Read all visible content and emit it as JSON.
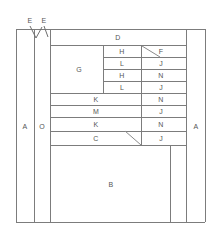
{
  "diagram": {
    "line_color": "#7c7c7c",
    "label_color": "#555555",
    "background": "#ffffff",
    "frame": {
      "x": 16,
      "y": 29,
      "width": 189,
      "height": 193
    },
    "dimension_markers": [
      {
        "label": "E",
        "x": 30,
        "y": 20
      },
      {
        "label": "E",
        "x": 44,
        "y": 20
      }
    ],
    "labels": [
      {
        "name": "region-a-left",
        "text": "A",
        "x": 25,
        "y": 126
      },
      {
        "name": "region-o",
        "text": "O",
        "x": 42,
        "y": 126
      },
      {
        "name": "region-a-right",
        "text": "A",
        "x": 196,
        "y": 126
      },
      {
        "name": "region-d",
        "text": "D",
        "x": 118,
        "y": 37
      },
      {
        "name": "region-g",
        "text": "G",
        "x": 79,
        "y": 69
      },
      {
        "name": "region-h-1",
        "text": "H",
        "x": 122,
        "y": 51
      },
      {
        "name": "region-f",
        "text": "F",
        "x": 161,
        "y": 51
      },
      {
        "name": "region-l-1",
        "text": "L",
        "x": 122,
        "y": 63
      },
      {
        "name": "region-j-1",
        "text": "J",
        "x": 161,
        "y": 63
      },
      {
        "name": "region-h-2",
        "text": "H",
        "x": 122,
        "y": 75
      },
      {
        "name": "region-n-1",
        "text": "N",
        "x": 161,
        "y": 75
      },
      {
        "name": "region-l-2",
        "text": "L",
        "x": 122,
        "y": 87
      },
      {
        "name": "region-j-2",
        "text": "J",
        "x": 161,
        "y": 87
      },
      {
        "name": "region-k-1",
        "text": "K",
        "x": 96,
        "y": 99
      },
      {
        "name": "region-n-2",
        "text": "N",
        "x": 161,
        "y": 99
      },
      {
        "name": "region-m",
        "text": "M",
        "x": 96,
        "y": 111
      },
      {
        "name": "region-j-3",
        "text": "J",
        "x": 161,
        "y": 111
      },
      {
        "name": "region-k-2",
        "text": "K",
        "x": 96,
        "y": 124
      },
      {
        "name": "region-n-3",
        "text": "N",
        "x": 161,
        "y": 124
      },
      {
        "name": "region-c",
        "text": "C",
        "x": 96,
        "y": 138
      },
      {
        "name": "region-j-4",
        "text": "J",
        "x": 161,
        "y": 138
      },
      {
        "name": "region-b",
        "text": "B",
        "x": 111,
        "y": 184
      }
    ],
    "horizontal_lines": [
      {
        "name": "frame-top",
        "x": 16,
        "y": 29,
        "length": 189
      },
      {
        "name": "frame-bottom",
        "x": 16,
        "y": 222,
        "length": 189
      },
      {
        "name": "row-d-bottom",
        "x": 50,
        "y": 45,
        "length": 136
      },
      {
        "name": "row-h1-bottom",
        "x": 103,
        "y": 57,
        "length": 83
      },
      {
        "name": "row-l1-bottom",
        "x": 103,
        "y": 69,
        "length": 83
      },
      {
        "name": "row-h2-bottom",
        "x": 103,
        "y": 81,
        "length": 83
      },
      {
        "name": "row-g-bottom",
        "x": 50,
        "y": 93,
        "length": 136
      },
      {
        "name": "row-k1-bottom",
        "x": 50,
        "y": 105,
        "length": 136
      },
      {
        "name": "row-m-bottom",
        "x": 50,
        "y": 117,
        "length": 136
      },
      {
        "name": "row-k2-bottom",
        "x": 50,
        "y": 131,
        "length": 136
      },
      {
        "name": "row-c-bottom",
        "x": 50,
        "y": 145,
        "length": 136
      }
    ],
    "vertical_lines": [
      {
        "name": "frame-left",
        "x": 16,
        "y": 29,
        "length": 193
      },
      {
        "name": "frame-right",
        "x": 205,
        "y": 29,
        "length": 193
      },
      {
        "name": "col-a-left-right",
        "x": 34,
        "y": 29,
        "length": 193
      },
      {
        "name": "col-o-right",
        "x": 50,
        "y": 29,
        "length": 193
      },
      {
        "name": "col-a-right-left",
        "x": 186,
        "y": 29,
        "length": 193
      },
      {
        "name": "col-g-right",
        "x": 103,
        "y": 45,
        "length": 48
      },
      {
        "name": "col-inner-split",
        "x": 141,
        "y": 45,
        "length": 100
      },
      {
        "name": "col-b-right",
        "x": 170,
        "y": 145,
        "length": 77
      }
    ],
    "diagonals": [
      {
        "name": "diagonal-upper",
        "x1": 142,
        "y1": 46,
        "x2": 160,
        "y2": 57
      },
      {
        "name": "diagonal-lower",
        "x1": 125,
        "y1": 131,
        "x2": 141,
        "y2": 145
      }
    ],
    "marker_ticks": [
      {
        "name": "tick-e-left",
        "x1": 30,
        "y1": 26,
        "x2": 36,
        "y2": 38
      },
      {
        "name": "tick-e-mid",
        "x1": 36,
        "y1": 38,
        "x2": 42,
        "y2": 27
      },
      {
        "name": "tick-e-right",
        "x1": 44,
        "y1": 26,
        "x2": 48,
        "y2": 37
      }
    ]
  }
}
